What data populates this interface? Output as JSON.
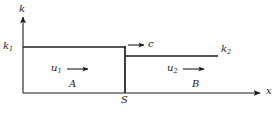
{
  "figure": {
    "type": "schematic-diagram",
    "background_color": "#ffffff",
    "line_color": "#1c1c1c",
    "axes": {
      "y_axis_label": "k",
      "x_axis_label": "x",
      "y_axis_x_px": 23,
      "y_axis_top_px": 15,
      "x_axis_y_px": 93,
      "x_axis_right_px": 262
    },
    "levels": [
      {
        "name": "k1",
        "symbol": "k",
        "subscript": "1",
        "y_px": 47,
        "x_start_px": 23,
        "x_end_px": 125
      },
      {
        "name": "k2",
        "symbol": "k",
        "subscript": "2",
        "y_px": 56,
        "x_start_px": 125,
        "x_end_px": 218
      }
    ],
    "step": {
      "name": "S",
      "label": "S",
      "x_px": 125,
      "y_top_px": 47,
      "y_bottom_px": 93
    },
    "regions": [
      {
        "label": "A",
        "side": "upstream"
      },
      {
        "label": "B",
        "side": "downstream"
      }
    ],
    "velocity_arrows": [
      {
        "symbol": "u",
        "subscript": "1",
        "label_x_px": 51,
        "label_y_px": 63,
        "arrow_from_px": 67,
        "arrow_to_px": 89,
        "arrow_y_px": 69
      },
      {
        "symbol": "u",
        "subscript": "2",
        "label_x_px": 167,
        "label_y_px": 63,
        "arrow_from_px": 183,
        "arrow_to_px": 205,
        "arrow_y_px": 69
      }
    ],
    "shock_arrow": {
      "symbol": "c",
      "label_x_px": 148,
      "arrow_from_px": 128,
      "arrow_to_px": 145,
      "arrow_y_px": 45
    },
    "labels": {
      "axis_k": "k",
      "axis_x": "x",
      "k1_symbol": "k",
      "k1_sub": "1",
      "k2_symbol": "k",
      "k2_sub": "2",
      "u1_symbol": "u",
      "u1_sub": "1",
      "u2_symbol": "u",
      "u2_sub": "2",
      "c": "c",
      "region_a": "A",
      "region_b": "B",
      "step_s": "S"
    }
  }
}
